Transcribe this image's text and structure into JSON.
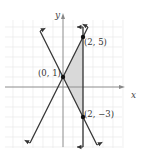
{
  "diagram": {
    "type": "coordinate-graph",
    "axes": {
      "x_label": "x",
      "y_label": "y"
    },
    "grid": {
      "unit_px": 10,
      "origin_px": [
        63,
        87
      ],
      "x_range": [
        -5.8,
        5.9
      ],
      "y_range": [
        -6.1,
        6.7
      ]
    },
    "lines": [
      {
        "name": "y = 2x + 1",
        "from": [
          -3.3,
          -5.6
        ],
        "to": [
          2.5,
          6
        ]
      },
      {
        "name": "y = -2x + 1",
        "from": [
          -2.3,
          5.6
        ],
        "to": [
          3.4,
          -5.8
        ]
      },
      {
        "name": "x = 2",
        "from": [
          2,
          6
        ],
        "to": [
          2,
          -6
        ]
      }
    ],
    "points": [
      {
        "label": "(0, 1)",
        "x": 0,
        "y": 1
      },
      {
        "label": "(2, 5)",
        "x": 2,
        "y": 5
      },
      {
        "label": "(2, −3)",
        "x": 2,
        "y": -3
      }
    ],
    "shaded_region": {
      "vertices": [
        [
          0,
          1
        ],
        [
          2,
          5
        ],
        [
          2,
          -3
        ]
      ],
      "color": "#d9d9d9"
    },
    "colors": {
      "grid": "#e6e6e6",
      "axis": "#888888",
      "line": "#333333",
      "point": "#111111"
    }
  }
}
